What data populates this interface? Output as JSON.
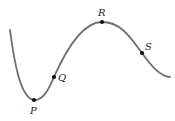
{
  "diagram": {
    "type": "curve-with-labeled-points",
    "curve_color": "#6e6e6e",
    "point_color": "#111111",
    "points": [
      {
        "label": "P",
        "x": 34,
        "y": 100,
        "lx": 30,
        "ly": 114
      },
      {
        "label": "Q",
        "x": 54,
        "y": 77,
        "lx": 58,
        "ly": 81
      },
      {
        "label": "R",
        "x": 102,
        "y": 22,
        "lx": 98,
        "ly": 16
      },
      {
        "label": "S",
        "x": 142,
        "y": 53,
        "lx": 145,
        "ly": 50
      }
    ]
  }
}
